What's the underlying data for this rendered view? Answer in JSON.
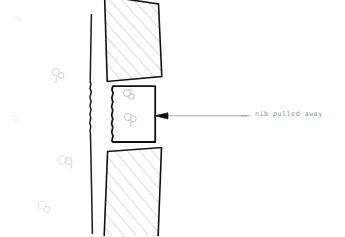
{
  "document": {
    "kind": "scanned-technical-sketch",
    "background_color": "#ffffff",
    "width": 345,
    "height": 236
  },
  "annotations": [
    {
      "id": "nib-pulled-away",
      "text": "nib pulled away",
      "color": "#8f8f8f",
      "x": 255,
      "y": 111
    }
  ],
  "leader": {
    "name": "leader-line",
    "color": "#9a9a9a",
    "dash_x": 244,
    "dash_y": 116,
    "line_from_x": 250,
    "line_from_y": 116,
    "line_to_x": 165,
    "line_to_y": 116,
    "arrow_color": "#111111",
    "arrow_tip_x": 155,
    "arrow_tip_y": 116
  },
  "shapes": {
    "wall_line": {
      "name": "vertical-wall-line",
      "color": "#1a1a1a",
      "stroke_width": 1.5,
      "description": "long near-vertical line with wavy break in the middle"
    },
    "upper_hatched_block": {
      "name": "upper-hatched-block",
      "stroke_color": "#111111",
      "hatch_color": "#b4b4b4",
      "stroke_width": 1.6,
      "description": "tilted quadrilateral with diagonal hatching, clipped at top"
    },
    "lower_hatched_block": {
      "name": "lower-hatched-block",
      "stroke_color": "#111111",
      "hatch_color": "#b4b4b4",
      "stroke_width": 1.6,
      "description": "tilted quadrilateral with diagonal hatching, clipped at bottom"
    },
    "nib_block": {
      "name": "nib-block",
      "stroke_color": "#111111",
      "stroke_width": 1.8,
      "fill": "#ffffff",
      "description": "central rectangle with wavy left edge representing the pulled-away nib"
    }
  },
  "ghost_marks": [
    {
      "name": "ghost-mark-1",
      "x": 16,
      "y": 18,
      "scale": 0.55,
      "opacity": 0.11,
      "rotate": -14
    },
    {
      "name": "ghost-mark-2",
      "x": 56,
      "y": 72,
      "scale": 1.0,
      "opacity": 0.2,
      "rotate": 10
    },
    {
      "name": "ghost-mark-3",
      "x": 14,
      "y": 118,
      "scale": 0.5,
      "opacity": 0.1,
      "rotate": 24
    },
    {
      "name": "ghost-mark-4",
      "x": 62,
      "y": 160,
      "scale": 1.05,
      "opacity": 0.2,
      "rotate": -6
    },
    {
      "name": "ghost-mark-5",
      "x": 42,
      "y": 205,
      "scale": 1.0,
      "opacity": 0.16,
      "rotate": 16
    },
    {
      "name": "ghost-mark-6",
      "x": 127,
      "y": 93,
      "scale": 1.0,
      "opacity": 0.3,
      "rotate": 8
    },
    {
      "name": "ghost-mark-7",
      "x": 128,
      "y": 117,
      "scale": 1.0,
      "opacity": 0.3,
      "rotate": -4
    }
  ]
}
